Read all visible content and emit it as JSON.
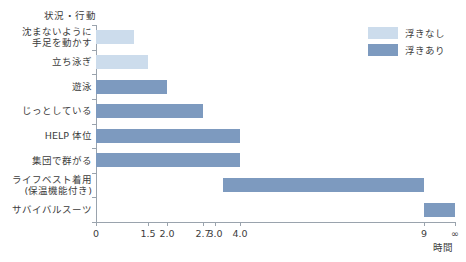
{
  "chart_data": {
    "type": "bar",
    "orientation": "horizontal",
    "title": "",
    "xlabel": "時間",
    "ylabel": "状況・行動",
    "grid": false,
    "legend_position": "top-right",
    "x_axis": {
      "tick_labels": [
        "0",
        "1.5",
        "2.0",
        "2.7",
        "3.0",
        "4.0",
        "9",
        "∞"
      ],
      "tick_values": [
        0,
        1.5,
        2.0,
        2.7,
        3.0,
        4.0,
        9,
        10
      ],
      "tick_positions_px": [
        0,
        52,
        71,
        107,
        119,
        144,
        328,
        359
      ],
      "note": "broken / non-linear axis"
    },
    "categories": [
      "沈まないように\n手足を動かす",
      "立ち泳ぎ",
      "遊泳",
      "じっとしている",
      "HELP 体位",
      "集団で群がる",
      "ライフベスト着用\n(保温機能付き)",
      "サバイバルスーツ"
    ],
    "bars": [
      {
        "label": "沈まないように手足を動かす",
        "label_lines": [
          "沈まないように",
          "手足を動かす"
        ],
        "start": 0,
        "end": 1.1,
        "series": "浮きなし",
        "color": "#ccdcec"
      },
      {
        "label": "立ち泳ぎ",
        "label_lines": [
          "立ち泳ぎ"
        ],
        "start": 0,
        "end": 1.5,
        "series": "浮きなし",
        "color": "#ccdcec"
      },
      {
        "label": "遊泳",
        "label_lines": [
          "遊泳"
        ],
        "start": 0,
        "end": 2.0,
        "series": "浮きあり",
        "color": "#7d9abf"
      },
      {
        "label": "じっとしている",
        "label_lines": [
          "じっとしている"
        ],
        "start": 0,
        "end": 2.7,
        "series": "浮きあり",
        "color": "#7d9abf"
      },
      {
        "label": "HELP 体位",
        "label_lines": [
          "HELP 体位"
        ],
        "start": 0,
        "end": 4.0,
        "series": "浮きあり",
        "color": "#7d9abf"
      },
      {
        "label": "集団で群がる",
        "label_lines": [
          "集団で群がる"
        ],
        "start": 0,
        "end": 4.0,
        "series": "浮きあり",
        "color": "#7d9abf"
      },
      {
        "label": "ライフベスト着用(保温機能付き)",
        "label_lines": [
          "ライフベスト着用",
          "(保温機能付き)"
        ],
        "start": 3.3,
        "end": 9.0,
        "series": "浮きあり",
        "color": "#7d9abf"
      },
      {
        "label": "サバイバルスーツ",
        "label_lines": [
          "サバイバルスーツ"
        ],
        "start": 9.0,
        "end": 10,
        "series": "浮きあり",
        "color": "#7d9abf"
      }
    ],
    "series": [
      {
        "name": "浮きなし",
        "color": "#ccdcec"
      },
      {
        "name": "浮きあり",
        "color": "#7d9abf"
      }
    ]
  },
  "legend": {
    "items": [
      {
        "label": "浮きなし"
      },
      {
        "label": "浮きあり"
      }
    ]
  },
  "caption": {
    "text": ""
  }
}
